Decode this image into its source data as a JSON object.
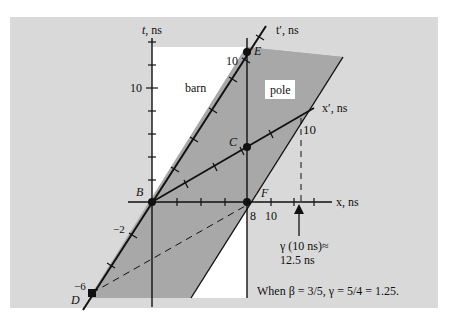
{
  "figure": {
    "axes": {
      "t_label": "t, ns",
      "x_label": "x, ns",
      "tprime_label": "t′, ns",
      "xprime_label": "x′, ns"
    },
    "regions": {
      "barn_label": "barn",
      "pole_label": "pole"
    },
    "points": {
      "B": "B",
      "C": "C",
      "D": "D",
      "E": "E",
      "F": "F"
    },
    "tick_labels": {
      "t_10": "10",
      "tprime_10": "10",
      "tprime_neg2": "−2",
      "tprime_neg6": "−6",
      "xprime_10": "10",
      "x_8": "8",
      "x_10": "10"
    },
    "annotations": {
      "gamma_line1": "γ (10 ns)≈",
      "gamma_line2": "12.5 ns",
      "caption": "When β = 3/5,  γ = 5/4 = 1.25."
    },
    "colors": {
      "panel": "#d9d9d9",
      "pole": "#a8a8a8",
      "barn": "#ffffff",
      "ink": "#111111"
    }
  }
}
